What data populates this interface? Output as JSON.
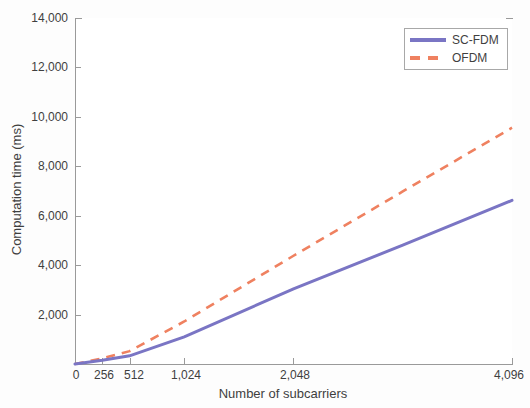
{
  "chart_data": {
    "type": "line",
    "title": "",
    "xlabel": "Number of subcarriers",
    "ylabel": "Computation time (ms)",
    "xlim": [
      0,
      4096
    ],
    "ylim": [
      0,
      14000
    ],
    "xticks": [
      0,
      256,
      512,
      1024,
      2048,
      4096
    ],
    "xtick_labels": [
      "0",
      "256",
      "512",
      "1,024",
      "2,048",
      "4,096"
    ],
    "yticks": [
      0,
      2000,
      4000,
      6000,
      8000,
      10000,
      12000,
      14000
    ],
    "ytick_labels": [
      "0",
      "2,000",
      "4,000",
      "6,000",
      "8,000",
      "10,000",
      "12,000",
      "14,000"
    ],
    "grid": false,
    "legend_position": "top-right",
    "x": [
      0,
      256,
      512,
      1024,
      2048,
      3072,
      4096
    ],
    "series": [
      {
        "name": "SC-FDM",
        "color": "#7a75c4",
        "style": "solid",
        "values": [
          0,
          150,
          330,
          1100,
          3040,
          4810,
          6620
        ]
      },
      {
        "name": "OFDM",
        "color": "#ef8160",
        "style": "dashed",
        "values": [
          0,
          230,
          520,
          1720,
          4380,
          6980,
          9560
        ]
      }
    ]
  },
  "axes": {
    "ylabel": "Computation time (ms)",
    "xlabel": "Number of subcarriers",
    "ytick_labels": [
      "14,000",
      "12,000",
      "10,000",
      "8,000",
      "6,000",
      "4,000",
      "2,000"
    ],
    "xtick_labels": [
      "0",
      "256",
      "512",
      "1,024",
      "2,048",
      "4,096"
    ]
  },
  "legend": {
    "entries": [
      {
        "label": "SC-FDM",
        "color": "#7a75c4",
        "style": "solid"
      },
      {
        "label": "OFDM",
        "color": "#ef8160",
        "style": "dashed"
      }
    ]
  },
  "colors": {
    "sc_fdm": "#7a75c4",
    "ofdm": "#ef8160",
    "axis": "#9a9a9a",
    "text": "#3f3f3f",
    "background": "#ffffff"
  }
}
